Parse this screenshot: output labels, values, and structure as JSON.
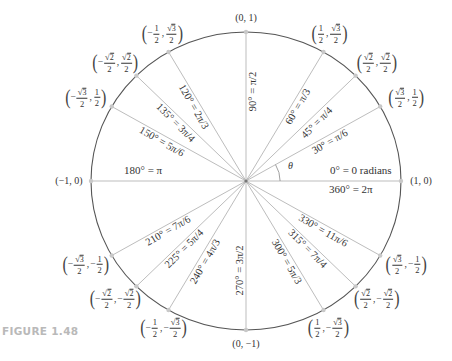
{
  "figure": {
    "caption": "FIGURE 1.48",
    "center": {
      "x": 246,
      "y": 181
    },
    "radius": {
      "x": 155,
      "y": 149
    },
    "colors": {
      "circle": "#555555",
      "spoke": "#bdbdbd",
      "axis": "#bdbdbd",
      "point": "#c8c8c8",
      "text": "#333333",
      "caption": "#b9b9b9"
    },
    "theta_label": "θ",
    "axis_labels": {
      "zero_radians": "0° = 0 radians",
      "full_turn": "360° = 2π",
      "half_turn": "180° = π"
    },
    "angles": [
      {
        "deg": 0,
        "coord": "(1, 0)"
      },
      {
        "deg": 30,
        "label": "30° = π/6",
        "coord": [
          "√3/2",
          "1/2"
        ]
      },
      {
        "deg": 45,
        "label": "45° = π/4",
        "coord": [
          "√2/2",
          "√2/2"
        ]
      },
      {
        "deg": 60,
        "label": "60° = π/3",
        "coord": [
          "1/2",
          "√3/2"
        ]
      },
      {
        "deg": 90,
        "label": "90° = π/2",
        "coord": "(0, 1)"
      },
      {
        "deg": 120,
        "label": "120° = 2π/3",
        "coord": [
          "−1/2",
          "√3/2"
        ]
      },
      {
        "deg": 135,
        "label": "135° = 3π/4",
        "coord": [
          "−√2/2",
          "√2/2"
        ]
      },
      {
        "deg": 150,
        "label": "150° = 5π/6",
        "coord": [
          "−√3/2",
          "1/2"
        ]
      },
      {
        "deg": 180,
        "coord": "(−1, 0)"
      },
      {
        "deg": 210,
        "label": "210° = 7π/6",
        "coord": [
          "−√3/2",
          "−1/2"
        ]
      },
      {
        "deg": 225,
        "label": "225° = 5π/4",
        "coord": [
          "−√2/2",
          "−√2/2"
        ]
      },
      {
        "deg": 240,
        "label": "240° = 4π/3",
        "coord": [
          "−1/2",
          "−√3/2"
        ]
      },
      {
        "deg": 270,
        "label": "270° = 3π/2",
        "coord": "(0, −1)"
      },
      {
        "deg": 300,
        "label": "300° = 5π/3",
        "coord": [
          "1/2",
          "−√3/2"
        ]
      },
      {
        "deg": 315,
        "label": "315° = 7π/4",
        "coord": [
          "√2/2",
          "−√2/2"
        ]
      },
      {
        "deg": 330,
        "label": "330° = 11π/6",
        "coord": [
          "√3/2",
          "−1/2"
        ]
      }
    ]
  }
}
